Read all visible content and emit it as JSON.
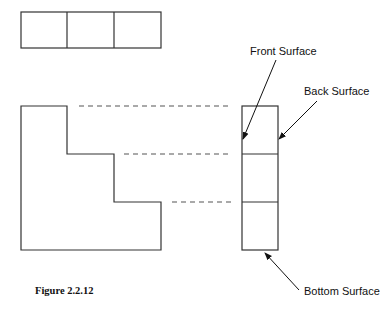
{
  "figure": {
    "caption": "Figure 2.2.12",
    "labels": {
      "front": "Front Surface",
      "back": "Back Surface",
      "bottom": "Bottom Surface"
    },
    "views": {
      "top_view": {
        "cells": 3
      },
      "front_view": {
        "shape": "L-shaped stepped profile",
        "steps": 3
      },
      "side_view": {
        "cells": 3
      }
    },
    "stroke_color": "#333333"
  }
}
